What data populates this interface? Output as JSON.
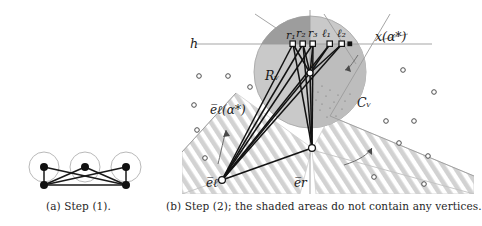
{
  "figure": {
    "panel_a": {
      "caption": "(a) Step (1).",
      "graph": {
        "top_vertices": [
          [
            44,
            167
          ],
          [
            85,
            167
          ],
          [
            126,
            167
          ]
        ],
        "bottom_vertices": [
          [
            44,
            185
          ],
          [
            126,
            185
          ]
        ],
        "circles_r": 14,
        "edges": [
          [
            [
              44,
              167
            ],
            [
              44,
              185
            ]
          ],
          [
            [
              126,
              167
            ],
            [
              126,
              185
            ]
          ],
          [
            [
              44,
              185
            ],
            [
              126,
              185
            ]
          ],
          [
            [
              44,
              167
            ],
            [
              126,
              185
            ]
          ],
          [
            [
              126,
              167
            ],
            [
              44,
              185
            ]
          ],
          [
            [
              85,
              167
            ],
            [
              44,
              185
            ]
          ],
          [
            [
              85,
              167
            ],
            [
              126,
              185
            ]
          ]
        ]
      }
    },
    "panel_b": {
      "caption": "(b) Step (2); the shaded areas do not contain any vertices.",
      "labels": {
        "h": "h",
        "x_alpha": "x(α*)",
        "R_v": "Rᵥ",
        "C_v": "Cᵥ",
        "e_l_alpha": "e̅ℓ(α*)",
        "e_l": "e̅ℓ",
        "e_r": "e̅r",
        "v": "v",
        "ports": [
          "r₁",
          "r₂",
          "r₃",
          "ℓ₁",
          "ℓ₂"
        ]
      },
      "geometry": {
        "disc_center": [
          310,
          72
        ],
        "disc_radius": 56,
        "h_line_y": 44,
        "h_line_x0": 196,
        "h_line_x1": 432,
        "vertex_v": [
          310,
          73
        ],
        "port_points": [
          [
            293,
            44
          ],
          [
            303,
            44
          ],
          [
            313,
            44
          ],
          [
            330,
            44
          ],
          [
            342,
            44
          ]
        ],
        "lower_node_1": [
          312,
          148
        ],
        "lower_node_2": [
          222,
          180
        ],
        "scatter_vertices": [
          [
            199,
            76
          ],
          [
            228,
            76
          ],
          [
            250,
            86
          ],
          [
            194,
            104
          ],
          [
            197,
            129
          ],
          [
            204,
            158
          ],
          [
            403,
            70
          ],
          [
            386,
            121
          ],
          [
            414,
            121
          ],
          [
            398,
            142
          ],
          [
            428,
            155
          ],
          [
            434,
            92
          ],
          [
            423,
            183
          ],
          [
            374,
            176
          ]
        ]
      },
      "colors": {
        "disc_fill": "#c6c6c6",
        "disc_dark_fill": "#9f9f9f",
        "hatch_fill": "#cfcfcf",
        "line": "#1a1a1a",
        "thin_line": "#8f8f8f"
      }
    }
  }
}
